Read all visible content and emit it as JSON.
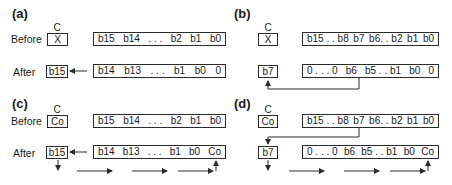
{
  "panels": {
    "a": {
      "label": "(a)",
      "carry_label": "C",
      "before_label": "Before",
      "after_label": "After",
      "carry_before": "X",
      "carry_after": "b15",
      "reg_before": [
        "b15",
        "b14",
        ". . .",
        "b2",
        "b1",
        "b0"
      ],
      "reg_after": [
        "b14",
        "b13",
        ". . .",
        "b1",
        "b0",
        "0"
      ]
    },
    "b": {
      "label": "(b)",
      "carry_label": "C",
      "carry_before": "X",
      "carry_after": "b7",
      "reg_before": [
        "b15 . . b8",
        "b7",
        "b6. . b2",
        "b1",
        "b0"
      ],
      "reg_after": [
        "0 . . . 0",
        "b6",
        "b5 . . b1",
        "b0",
        "0"
      ]
    },
    "c": {
      "label": "(c)",
      "carry_label": "C",
      "before_label": "Before",
      "after_label": "After",
      "carry_before": "Co",
      "carry_after": "b15",
      "reg_before": [
        "b15",
        "b14",
        ". . .",
        "b2",
        "b1",
        "b0"
      ],
      "reg_after": [
        "b14",
        "b13",
        ". . .",
        "b1",
        "b0",
        "Co"
      ]
    },
    "d": {
      "label": "(d)",
      "carry_label": "C",
      "carry_before": "Co",
      "carry_after": "b7",
      "reg_before": [
        "b15 . . b8",
        "b7",
        "b6. . b2",
        "b1",
        "b0"
      ],
      "reg_after": [
        "0 . . . 0",
        "b6",
        "b5 . . b1",
        "b0",
        "Co"
      ]
    }
  },
  "colors": {
    "line": "#2a2a2a",
    "background": "#ffffff"
  }
}
